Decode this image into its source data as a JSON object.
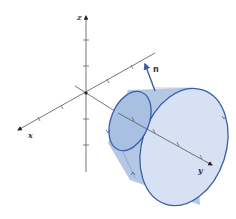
{
  "diagram": {
    "axes": {
      "x_label": "x",
      "y_label": "y",
      "z_label": "z"
    },
    "normal_vector_label": "n",
    "colors": {
      "axis": "#555555",
      "surface_fill": "#d6e2f3",
      "cone_side_fill": "#b4c8e6",
      "small_disk_fill": "#a9c0e2",
      "outline": "#3a5fa8",
      "arrow": "#3a5fa8"
    }
  }
}
